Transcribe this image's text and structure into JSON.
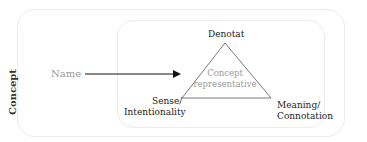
{
  "diagram": {
    "outer_label": "Concept",
    "name_label": "Name",
    "triangle": {
      "top": "Denotat",
      "center_line1": "Concept",
      "center_line2": "representative",
      "left_line1": "Sense/",
      "left_line2": "Intentionality",
      "right_line1": "Meaning/",
      "right_line2": "Connotation"
    }
  }
}
